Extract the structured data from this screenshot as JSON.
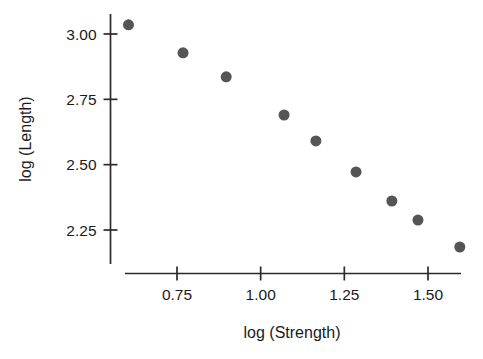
{
  "chart_data": {
    "type": "scatter",
    "title": "",
    "subtitle": "",
    "xlabel": "log (Strength)",
    "ylabel": "log (Length)",
    "xlim": [
      0.56,
      1.64
    ],
    "ylim": [
      2.14,
      3.08
    ],
    "grid": false,
    "legend": null,
    "legend_position": "none",
    "marker": {
      "shape": "circle",
      "color": "#555555",
      "size_px": 11
    },
    "x_ticks": [
      0.75,
      1.0,
      1.25,
      1.5
    ],
    "x_tick_labels": [
      "0.75",
      "1.00",
      "1.25",
      "1.50"
    ],
    "y_ticks": [
      2.25,
      2.5,
      2.75,
      3.0
    ],
    "y_tick_labels": [
      "2.25",
      "2.50",
      "2.75",
      "3.00"
    ],
    "points": [
      {
        "x": 0.605,
        "y": 3.035
      },
      {
        "x": 0.768,
        "y": 2.928
      },
      {
        "x": 0.897,
        "y": 2.836
      },
      {
        "x": 1.07,
        "y": 2.69
      },
      {
        "x": 1.165,
        "y": 2.591
      },
      {
        "x": 1.285,
        "y": 2.472
      },
      {
        "x": 1.392,
        "y": 2.361
      },
      {
        "x": 1.47,
        "y": 2.288
      },
      {
        "x": 1.595,
        "y": 2.185
      }
    ],
    "series": [
      {
        "name": "log(Length) vs log(Strength)",
        "x": [
          0.605,
          0.768,
          0.897,
          1.07,
          1.165,
          1.285,
          1.392,
          1.47,
          1.595
        ],
        "values": [
          3.035,
          2.928,
          2.836,
          2.69,
          2.591,
          2.472,
          2.361,
          2.288,
          2.185
        ]
      }
    ],
    "annotations": []
  },
  "axes": {
    "x_axis_name": "log (Strength)",
    "y_axis_name": "log (Length)"
  }
}
